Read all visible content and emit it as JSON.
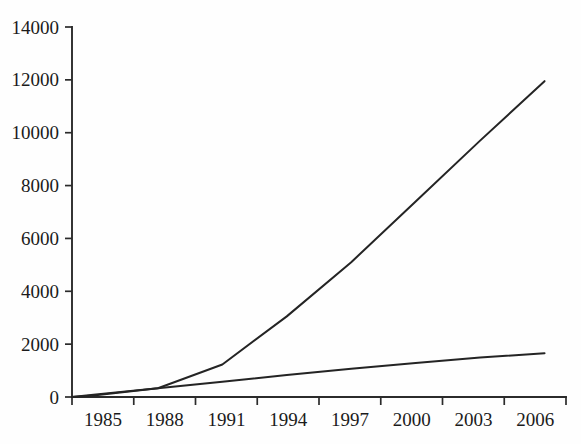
{
  "chart_data": {
    "type": "line",
    "title": "",
    "subtitle": "",
    "xlabel": "",
    "ylabel": "",
    "xlim": [
      1984,
      2007
    ],
    "ylim": [
      0,
      14000
    ],
    "grid": false,
    "legend": false,
    "legend_position": "none",
    "line_color": "#242424",
    "axis_color": "#2b2b2b",
    "background_color": "#fefefe",
    "y_ticks": [
      "0",
      "2000",
      "4000",
      "6000",
      "8000",
      "10000",
      "12000",
      "14000"
    ],
    "y_tick_values": [
      0,
      2000,
      4000,
      6000,
      8000,
      10000,
      12000,
      14000
    ],
    "x_ticks": [
      "1985",
      "1988",
      "1991",
      "1994",
      "1997",
      "2000",
      "2003",
      "2006"
    ],
    "x_tick_values": [
      1985,
      1988,
      1991,
      1994,
      1997,
      2000,
      2003,
      2006
    ],
    "x_tick_count": 9,
    "series": [
      {
        "name": "upper-series",
        "x": [
          1984,
          1985,
          1988,
          1991,
          1994,
          1997,
          2000,
          2003,
          2006
        ],
        "values": [
          0,
          60,
          330,
          1230,
          3050,
          5100,
          7400,
          9700,
          11950
        ]
      },
      {
        "name": "lower-series",
        "x": [
          1984,
          1985,
          1988,
          1991,
          1994,
          1997,
          2000,
          2003,
          2006
        ],
        "values": [
          0,
          90,
          330,
          580,
          830,
          1070,
          1290,
          1490,
          1660
        ]
      }
    ]
  }
}
